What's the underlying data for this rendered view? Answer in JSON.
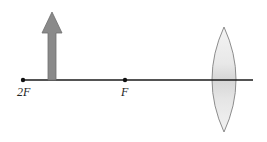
{
  "diagram": {
    "type": "optics-ray-diagram",
    "colors": {
      "background": "#ffffff",
      "axis": "#1a1a1a",
      "object_arrow": "#8a8a8a",
      "object_arrow_outline": "#6e6e6e",
      "lens_fill": "#e6e6e6",
      "lens_outline": "#8c8c8c",
      "point": "#111111"
    },
    "principal_axis": {
      "x1": 23,
      "y": 80,
      "x2": 253
    },
    "points": [
      {
        "id": "2F",
        "label": "2F",
        "x": 23,
        "y": 80,
        "label_x": 17,
        "label_y": 96
      },
      {
        "id": "F",
        "label": "F",
        "x": 125,
        "y": 80,
        "label_x": 121,
        "label_y": 96
      }
    ],
    "object": {
      "name": "object-arrow",
      "x": 52,
      "base_y": 80,
      "tip_y": 12,
      "shaft_half_width": 4,
      "head_half_width": 10,
      "head_base_y": 33
    },
    "lens": {
      "name": "converging-lens",
      "cx": 224,
      "top_y": 27,
      "bottom_y": 132,
      "half_width": 12
    }
  }
}
